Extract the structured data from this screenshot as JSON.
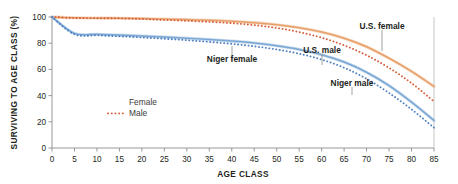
{
  "chart_data": {
    "type": "line",
    "title": "",
    "xlabel": "AGE CLASS",
    "ylabel": "SURVIVING TO AGE CLASS (%)",
    "xlim": [
      0,
      85
    ],
    "ylim": [
      0,
      100
    ],
    "xticks": [
      0,
      5,
      10,
      15,
      20,
      25,
      30,
      35,
      40,
      45,
      50,
      55,
      60,
      65,
      70,
      75,
      80,
      85
    ],
    "yticks": [
      0,
      20,
      40,
      60,
      80,
      100
    ],
    "grid": false,
    "legend_position": "lower-left-inside",
    "x": [
      0,
      5,
      10,
      15,
      20,
      25,
      30,
      35,
      40,
      45,
      50,
      55,
      60,
      65,
      70,
      75,
      80,
      85
    ],
    "series": [
      {
        "name": "U.S. female",
        "style": "solid",
        "color": "#e8a06a",
        "values": [
          100,
          99.4,
          99.2,
          99.1,
          98.8,
          98.4,
          98.0,
          97.5,
          96.8,
          95.7,
          94.1,
          91.8,
          88.5,
          83.8,
          77.3,
          68.5,
          58.5,
          47.0
        ]
      },
      {
        "name": "U.S. male",
        "style": "dotted",
        "color": "#d4603c",
        "values": [
          100,
          99.3,
          99.1,
          99.0,
          98.5,
          97.8,
          97.1,
          96.3,
          95.3,
          93.8,
          91.6,
          88.5,
          84.2,
          78.4,
          70.8,
          61.2,
          49.5,
          35.5
        ]
      },
      {
        "name": "Niger female",
        "style": "solid",
        "color": "#7aa7d4",
        "values": [
          100,
          87.5,
          86.8,
          86.2,
          85.5,
          84.7,
          83.8,
          82.8,
          81.6,
          80.1,
          78.0,
          75.2,
          71.2,
          65.6,
          57.8,
          47.6,
          35.0,
          21.0
        ]
      },
      {
        "name": "Niger male",
        "style": "dotted",
        "color": "#4f7fc0",
        "values": [
          100,
          86.8,
          86.0,
          85.3,
          84.4,
          83.4,
          82.3,
          81.0,
          79.5,
          77.6,
          75.2,
          72.0,
          67.5,
          61.3,
          52.8,
          42.0,
          29.5,
          15.5
        ]
      }
    ],
    "annotations": [
      {
        "text": "U.S. female",
        "x": 72.5,
        "y": 80.5
      },
      {
        "text": "U.S. male",
        "x": 60.5,
        "y": 64.0
      },
      {
        "text": "Niger female",
        "x": 39.5,
        "y": 50.0
      },
      {
        "text": "Niger male",
        "x": 65.0,
        "y": 35.5
      }
    ],
    "legend": [
      {
        "label": "Female",
        "style": "solid"
      },
      {
        "label": "Male",
        "style": "dotted"
      }
    ]
  }
}
